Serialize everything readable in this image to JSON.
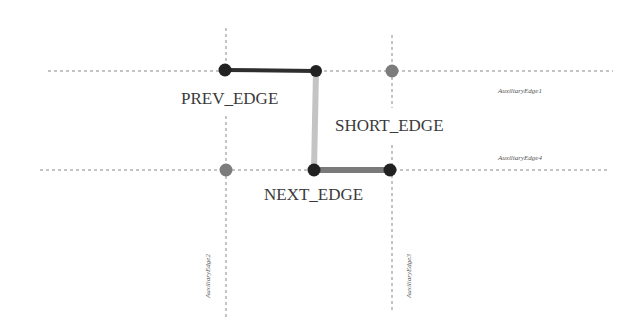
{
  "diagram": {
    "colors": {
      "background": "#ffffff",
      "dashed_line": "#8a8a8a",
      "prev_edge": "#2e2e2e",
      "short_edge": "#c4c4c4",
      "next_edge": "#7a7a7a",
      "node_dark": "#222222",
      "node_gray": "#7c7c7c"
    },
    "labels": {
      "prev_edge": "PREV_EDGE",
      "short_edge": "SHORT_EDGE",
      "next_edge": "NEXT_EDGE",
      "aux_edge_1": "AuxiliaryEdge1",
      "aux_edge_2": "AuxiliaryEdge2",
      "aux_edge_3": "AuxiliaryEdge3",
      "aux_edge_4": "AuxiliaryEdge4"
    },
    "auxiliary_lines": [
      {
        "name": "AuxiliaryEdge1",
        "orientation": "horizontal",
        "y": 71,
        "x1": 48,
        "x2": 613
      },
      {
        "name": "AuxiliaryEdge4",
        "orientation": "horizontal",
        "y": 170,
        "x1": 40,
        "x2": 610
      },
      {
        "name": "AuxiliaryEdge2",
        "orientation": "vertical",
        "x": 226,
        "y1": 28,
        "y2": 318
      },
      {
        "name": "AuxiliaryEdge3",
        "orientation": "vertical",
        "x": 392,
        "y1": 35,
        "y2": 313
      }
    ],
    "edges": [
      {
        "name": "PREV_EDGE",
        "from": [
          225,
          70
        ],
        "to": [
          316,
          71
        ]
      },
      {
        "name": "SHORT_EDGE",
        "from": [
          316,
          71
        ],
        "to": [
          314,
          170
        ]
      },
      {
        "name": "NEXT_EDGE",
        "from": [
          314,
          170
        ],
        "to": [
          390,
          170
        ]
      }
    ],
    "nodes": [
      {
        "x": 225,
        "y": 70,
        "type": "dark"
      },
      {
        "x": 316,
        "y": 71,
        "type": "dark"
      },
      {
        "x": 392,
        "y": 71,
        "type": "gray"
      },
      {
        "x": 226,
        "y": 170,
        "type": "gray"
      },
      {
        "x": 314,
        "y": 170,
        "type": "dark"
      },
      {
        "x": 390,
        "y": 170,
        "type": "dark"
      }
    ]
  }
}
